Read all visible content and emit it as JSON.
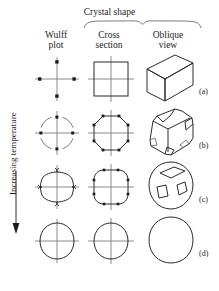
{
  "figure": {
    "header": {
      "group_title": "Crystal shape",
      "bracket_icon": "curly-brace-down-icon"
    },
    "columns": [
      {
        "id": "wulff",
        "line1": "Wulff",
        "line2": "plot"
      },
      {
        "id": "cross",
        "line1": "Cross",
        "line2": "section"
      },
      {
        "id": "oblique",
        "line1": "Oblique",
        "line2": "view"
      }
    ],
    "y_axis": {
      "label": "Increasing temperature",
      "direction": "down",
      "arrow_icon": "arrow-down-icon"
    },
    "rows": [
      {
        "label": "(a)",
        "wulff_plot": "four-cusp-points-on-axes",
        "cross_section": "square",
        "oblique_view": "cube"
      },
      {
        "label": "(b)",
        "wulff_plot": "four-points-with-arcs",
        "cross_section": "octagon-truncated-square",
        "oblique_view": "truncated-cube"
      },
      {
        "label": "(c)",
        "wulff_plot": "cloverleaf-cusped-curve",
        "cross_section": "rounded-square",
        "oblique_view": "rounded-cube-with-facets"
      },
      {
        "label": "(d)",
        "wulff_plot": "near-circle",
        "cross_section": "near-circle",
        "oblique_view": "sphere-like-blob"
      }
    ],
    "colors": {
      "ink": "#2a2a2a",
      "axis": "#808080",
      "background": "#ffffff"
    }
  }
}
